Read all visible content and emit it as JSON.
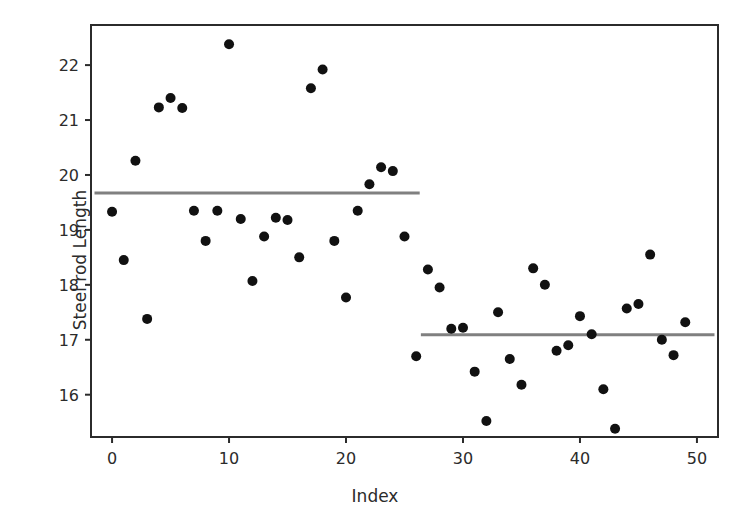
{
  "chart_data": {
    "type": "scatter",
    "title": "",
    "xlabel": "Index",
    "ylabel": "Steel rod Length",
    "xlim": [
      -1.8,
      51.8
    ],
    "ylim": [
      15.23,
      22.73
    ],
    "xticks": [
      0,
      10,
      20,
      30,
      40,
      50
    ],
    "yticks": [
      16,
      17,
      18,
      19,
      20,
      21,
      22
    ],
    "grid": false,
    "legend": false,
    "marker": {
      "shape": "circle",
      "color": "#111111",
      "size": 5
    },
    "series": [
      {
        "name": "Steel rod Length",
        "x": [
          0,
          1,
          2,
          3,
          4,
          5,
          6,
          7,
          8,
          9,
          10,
          11,
          12,
          13,
          14,
          15,
          16,
          17,
          18,
          19,
          20,
          21,
          22,
          23,
          24,
          25,
          26,
          27,
          28,
          29,
          30,
          31,
          32,
          33,
          34,
          35,
          36,
          37,
          38,
          39,
          40,
          41,
          42,
          43,
          44,
          45,
          46,
          47,
          48,
          49
        ],
        "y": [
          19.33,
          18.45,
          20.26,
          17.38,
          21.23,
          21.4,
          21.22,
          19.35,
          18.8,
          19.35,
          22.38,
          19.2,
          18.07,
          18.88,
          19.22,
          19.18,
          18.5,
          21.58,
          21.92,
          18.8,
          17.77,
          19.35,
          19.83,
          20.14,
          20.07,
          18.88,
          16.7,
          18.28,
          17.95,
          17.2,
          17.22,
          16.42,
          15.52,
          17.5,
          16.65,
          16.18,
          18.3,
          18.0,
          16.8,
          16.9,
          17.43,
          17.1,
          16.1,
          15.38,
          17.57,
          17.65,
          18.55,
          17.0,
          16.72,
          17.32
        ]
      }
    ],
    "annotations": [
      {
        "name": "mean-segment-1",
        "type": "hline-segment",
        "y": 19.67,
        "x_start": -1.5,
        "x_end": 26.3,
        "color": "#808080",
        "linewidth": 3
      },
      {
        "name": "mean-segment-2",
        "type": "hline-segment",
        "y": 17.09,
        "x_start": 26.4,
        "x_end": 51.5,
        "color": "#808080",
        "linewidth": 3
      }
    ]
  },
  "figure": {
    "background": "#ffffff",
    "axes_color": "#2b2b2b",
    "x_axis_label": "Index",
    "y_axis_label": "Steel rod Length",
    "x_tick_labels": [
      "0",
      "10",
      "20",
      "30",
      "40",
      "50"
    ],
    "y_tick_labels": [
      "16",
      "17",
      "18",
      "19",
      "20",
      "21",
      "22"
    ]
  }
}
